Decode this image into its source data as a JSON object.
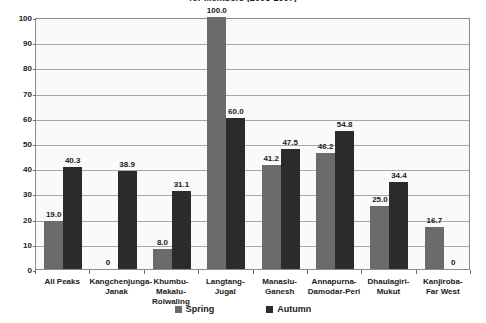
{
  "chart_data": {
    "type": "bar",
    "title": "for Members (2003-2007)",
    "xlabel": "",
    "ylabel": "",
    "ylim": [
      0,
      100
    ],
    "yticks": [
      0,
      10,
      20,
      30,
      40,
      50,
      60,
      70,
      80,
      90,
      100
    ],
    "grid": true,
    "legend_position": "bottom",
    "categories": [
      "All Peaks",
      "Kangchenjunga-Janak",
      "Khumbu-Makalu-Rolwaling",
      "Langtang-Jugal",
      "Manaslu-Ganesh",
      "Annapurna-Damodar-Peri",
      "Dhaulagiri-Mukut",
      "Kanjiroba-Far West"
    ],
    "category_lines": [
      [
        "All Peaks"
      ],
      [
        "Kangchenjunga-",
        "Janak"
      ],
      [
        "Khumbu-",
        "Makalu-",
        "Rolwaling"
      ],
      [
        "Langtang-",
        "Jugal"
      ],
      [
        "Manaslu-",
        "Ganesh"
      ],
      [
        "Annapurna-",
        "Damodar-Peri"
      ],
      [
        "Dhaulagiri-",
        "Mukut"
      ],
      [
        "Kanjiroba-",
        "Far West"
      ]
    ],
    "series": [
      {
        "name": "Spring",
        "color": "#6b6b6b",
        "values": [
          19.0,
          0,
          8.0,
          100.0,
          41.2,
          46.2,
          25.0,
          16.7
        ],
        "labels": [
          "19.0",
          "0",
          "8.0",
          "100.0",
          "41.2",
          "46.2",
          "25.0",
          "16.7"
        ]
      },
      {
        "name": "Autumn",
        "color": "#2b2b2b",
        "values": [
          40.3,
          38.9,
          31.1,
          60.0,
          47.5,
          54.8,
          34.4,
          0
        ],
        "labels": [
          "40.3",
          "38.9",
          "31.1",
          "60.0",
          "47.5",
          "54.8",
          "34.4",
          "0"
        ]
      }
    ]
  },
  "legend": {
    "items": [
      {
        "label": "Spring"
      },
      {
        "label": "Autumn"
      }
    ]
  }
}
